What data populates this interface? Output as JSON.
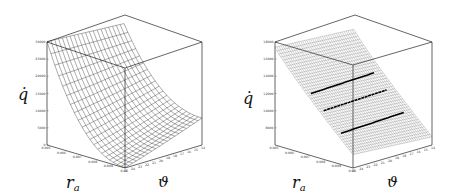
{
  "chart_data": [
    {
      "type": "surface3d",
      "title": "",
      "xlabel": "r_a",
      "ylabel": "ϑ",
      "zlabel": "q̇",
      "x_ticks": [
        "0.005",
        "0.006",
        "0.007",
        "0.008",
        "0.009",
        "0.01"
      ],
      "y_ticks": [
        "25",
        "24",
        "23",
        "22",
        "21",
        "20",
        "19",
        "18",
        "17",
        "16",
        "15",
        "14"
      ],
      "z_ticks": [
        "0",
        "5000",
        "10000",
        "15000",
        "20000",
        "25000",
        "30000"
      ],
      "zlim": [
        0,
        30000
      ],
      "grid": false,
      "description": "Wireframe surface: max ~30000 at r_a=0.005 corner, falls steeply toward r_a=0.01, ϑ=25 (~0), saddle-like to ~8000 at ϑ=14"
    },
    {
      "type": "surface3d",
      "title": "",
      "xlabel": "r_a",
      "ylabel": "ϑ",
      "zlabel": "q̇",
      "x_ticks": [
        "0.005",
        "0.006",
        "0.007",
        "0.008",
        "0.009",
        "0.01"
      ],
      "y_ticks": [
        "25",
        "24",
        "23",
        "22",
        "21",
        "20",
        "19",
        "18",
        "17",
        "16",
        "15",
        "14"
      ],
      "z_ticks": [
        "8000",
        "10000",
        "12000",
        "14000",
        "16000",
        "18000"
      ],
      "zlim": [
        6000,
        18000
      ],
      "grid": false,
      "contour_lines": [
        12000,
        10000,
        8000
      ],
      "description": "Dense wireframe plane: max ~18000 at r_a=0.005, decreasing to ~6000 at r_a=0.01; three bold contour lines"
    }
  ],
  "labels": {
    "z_axis": "q̇",
    "x_axis_main": "r",
    "x_axis_sub": "a",
    "y_axis": "ϑ"
  }
}
